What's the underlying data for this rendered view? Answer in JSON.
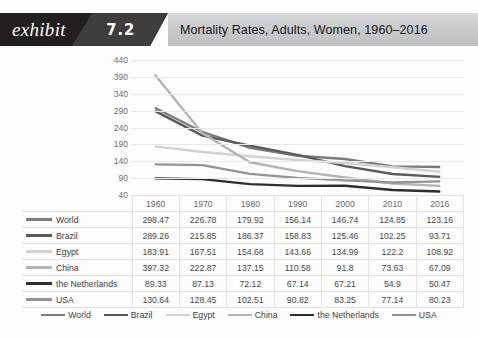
{
  "header": {
    "exhibit_label": "exhibit",
    "exhibit_number": "7.2",
    "title": "Mortality Rates, Adults, Women, 1960–2016"
  },
  "chart_data": {
    "type": "line",
    "title": "Mortality Rates, Adults, Women, 1960–2016",
    "xlabel": "",
    "ylabel": "",
    "x": [
      1960,
      1970,
      1980,
      1990,
      2000,
      2010,
      2016
    ],
    "categories": [
      "1960",
      "1970",
      "1980",
      "1990",
      "2000",
      "2010",
      "2016"
    ],
    "ylim": [
      40,
      440
    ],
    "yticks": [
      440,
      390,
      340,
      290,
      240,
      190,
      140,
      90,
      40
    ],
    "grid": true,
    "legend_position": "bottom",
    "series": [
      {
        "name": "World",
        "color": "#7c7c7c",
        "width": 2.4,
        "values": [
          298.47,
          226.78,
          179.92,
          156.14,
          146.74,
          124.85,
          123.16
        ]
      },
      {
        "name": "Brazil",
        "color": "#5a5a5a",
        "width": 2.4,
        "values": [
          289.26,
          215.85,
          186.37,
          158.83,
          125.46,
          102.25,
          93.71
        ]
      },
      {
        "name": "Egypt",
        "color": "#d2d2d2",
        "width": 2.4,
        "values": [
          183.91,
          167.51,
          154.68,
          143.66,
          134.99,
          122.2,
          108.92
        ]
      },
      {
        "name": "China",
        "color": "#b4b4b4",
        "width": 2.4,
        "values": [
          397.32,
          222.87,
          137.15,
          110.58,
          91.8,
          73.63,
          67.09
        ]
      },
      {
        "name": "the Netherlands",
        "color": "#2e2e2e",
        "width": 2.4,
        "values": [
          89.33,
          87.13,
          72.12,
          67.14,
          67.21,
          54.9,
          50.47
        ]
      },
      {
        "name": "USA",
        "color": "#949494",
        "width": 2.4,
        "values": [
          130.64,
          128.45,
          102.51,
          90.82,
          83.25,
          77.14,
          80.23
        ]
      }
    ]
  },
  "table": {
    "corner_label": "",
    "columns": [
      "1960",
      "1970",
      "1980",
      "1990",
      "2000",
      "2010",
      "2016"
    ],
    "rows": [
      {
        "label": "World",
        "color": "#7c7c7c",
        "values": [
          "298.47",
          "226.78",
          "179.92",
          "156.14",
          "146.74",
          "124.85",
          "123.16"
        ]
      },
      {
        "label": "Brazil",
        "color": "#5a5a5a",
        "values": [
          "289.26",
          "215.85",
          "186.37",
          "158.83",
          "125.46",
          "102.25",
          "93.71"
        ]
      },
      {
        "label": "Egypt",
        "color": "#d2d2d2",
        "values": [
          "183.91",
          "167.51",
          "154.68",
          "143.66",
          "134.99",
          "122.2",
          "108.92"
        ]
      },
      {
        "label": "China",
        "color": "#b4b4b4",
        "values": [
          "397.32",
          "222.87",
          "137.15",
          "110.58",
          "91.8",
          "73.63",
          "67.09"
        ]
      },
      {
        "label": "the Netherlands",
        "color": "#2e2e2e",
        "values": [
          "89.33",
          "87.13",
          "72.12",
          "67.14",
          "67.21",
          "54.9",
          "50.47"
        ]
      },
      {
        "label": "USA",
        "color": "#949494",
        "values": [
          "130.64",
          "128.45",
          "102.51",
          "90.82",
          "83.25",
          "77.14",
          "80.23"
        ]
      }
    ]
  },
  "legend": {
    "items": [
      {
        "label": "World",
        "color": "#7c7c7c"
      },
      {
        "label": "Brazil",
        "color": "#5a5a5a"
      },
      {
        "label": "Egypt",
        "color": "#d2d2d2"
      },
      {
        "label": "China",
        "color": "#b4b4b4"
      },
      {
        "label": "the Netherlands",
        "color": "#2e2e2e"
      },
      {
        "label": "USA",
        "color": "#949494"
      }
    ]
  },
  "colors": {
    "header_black": "#231f20",
    "header_wedge": "#3f3c3d",
    "header_band": "#c9cacc",
    "gridline": "#e9e9e9",
    "table_border": "#e2e2e2"
  }
}
